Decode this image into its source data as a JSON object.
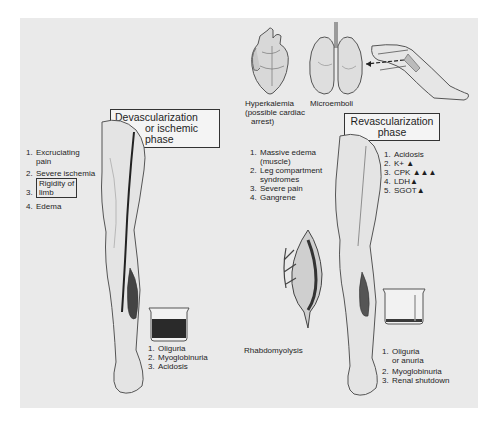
{
  "figure": {
    "background_color": "#eaeaea",
    "ink_color": "#1e1e1e"
  },
  "top_illustrations": {
    "heart": {
      "icon": "heart-icon",
      "label_line1": "Hyperkalemia",
      "label_line2": "(possible cardiac",
      "label_line3": "arrest)"
    },
    "lungs": {
      "icon": "lungs-icon",
      "label": "Microemboli"
    },
    "leg": {
      "icon": "leg-icon"
    }
  },
  "devascularization": {
    "title_line1": "Devascularization",
    "title_line2": "or ischemic",
    "title_line3": "phase",
    "symptoms": [
      {
        "num": "1.",
        "line1": "Excruciating",
        "line2": "pain"
      },
      {
        "num": "2.",
        "line1": "Severe ischemia"
      },
      {
        "num": "3.",
        "line1": "Rigidity of",
        "line2": "limb",
        "boxed": true
      },
      {
        "num": "4.",
        "line1": "Edema"
      }
    ],
    "beaker_findings": [
      {
        "num": "1.",
        "text": "Oliguria"
      },
      {
        "num": "2.",
        "text": "Myoglobinuria"
      },
      {
        "num": "3.",
        "text": "Acidosis"
      }
    ]
  },
  "revascularization": {
    "title_line1": "Revascularization",
    "title_line2": "phase",
    "local_effects": [
      {
        "num": "1.",
        "line1": "Massive edema",
        "line2": "(muscle)"
      },
      {
        "num": "2.",
        "line1": "Leg compartment",
        "line2": "syndromes"
      },
      {
        "num": "3.",
        "line1": "Severe pain"
      },
      {
        "num": "4.",
        "line1": "Gangrene"
      }
    ],
    "lab_findings": [
      {
        "num": "1.",
        "text": "Acidosis",
        "arrows": ""
      },
      {
        "num": "2.",
        "text": "K+",
        "arrows": "▲"
      },
      {
        "num": "3.",
        "text": "CPK",
        "arrows": "▲▲▲"
      },
      {
        "num": "4.",
        "text": "LDH",
        "arrows": "▲"
      },
      {
        "num": "5.",
        "text": "SGOT",
        "arrows": "▲"
      }
    ],
    "muscle_label": "Rhabdomyolysis",
    "beaker_findings": [
      {
        "num": "1.",
        "line1": "Oliguria",
        "line2": "or anuria"
      },
      {
        "num": "2.",
        "line1": "Myoglobinuria"
      },
      {
        "num": "3.",
        "line1": "Renal shutdown"
      }
    ]
  }
}
